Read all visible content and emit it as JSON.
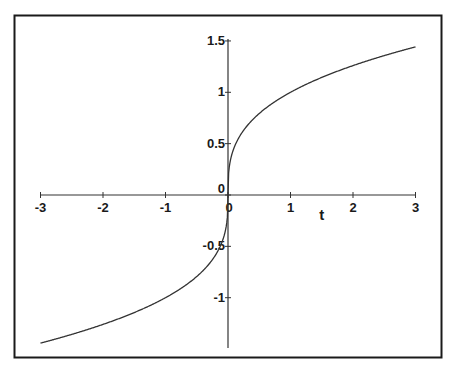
{
  "chart_data": {
    "type": "line",
    "title": "",
    "function": "t^(1/3)",
    "xlabel": "t",
    "ylabel": "",
    "xlim": [
      -3,
      3
    ],
    "ylim": [
      -1.5,
      1.5
    ],
    "grid": false,
    "legend": null,
    "x_ticks": [
      -3,
      -2,
      -1,
      0,
      1,
      2,
      3
    ],
    "x_tick_labels": [
      "-3",
      "-2",
      "-1",
      "0",
      "1",
      "2",
      "3"
    ],
    "y_ticks": [
      -1,
      -0.5,
      0,
      0.5,
      1,
      1.5
    ],
    "y_tick_labels": [
      "-1",
      "-0.5",
      "0",
      "0.5",
      "1",
      "1.5"
    ],
    "series": [
      {
        "name": "cube root of t",
        "color": "#333333",
        "x": [
          -3,
          -2.5,
          -2,
          -1.5,
          -1,
          -0.5,
          -0.25,
          -0.1,
          -0.01,
          0,
          0.01,
          0.1,
          0.25,
          0.5,
          1,
          1.5,
          2,
          2.5,
          3
        ],
        "y": [
          -1.442,
          -1.357,
          -1.26,
          -1.145,
          -1,
          -0.794,
          -0.63,
          -0.464,
          -0.215,
          0,
          0.215,
          0.464,
          0.63,
          0.794,
          1,
          1.145,
          1.26,
          1.357,
          1.442
        ]
      }
    ]
  },
  "axes": {
    "x_label": "t",
    "origin_marker": "0"
  },
  "colors": {
    "frame": "#1a1a1a",
    "axis": "#333333",
    "curve": "#333333",
    "background": "#ffffff"
  }
}
